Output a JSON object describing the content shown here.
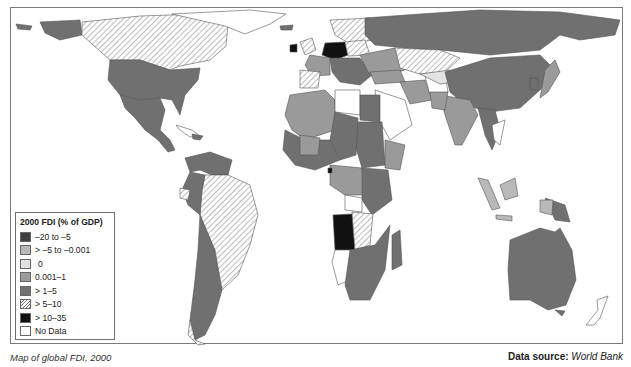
{
  "map": {
    "title": "Map of global FDI, 2000",
    "source_label": "Data source:",
    "source_value": "World Bank",
    "colors": {
      "neg_high": "#3f3f3f",
      "neg_low": "#b9b9b9",
      "zero": "#e3e3e3",
      "low": "#9a9a9a",
      "mid": "#707070",
      "hatch": "hatched",
      "high": "#111111",
      "no_data": "#ffffff"
    }
  },
  "legend": {
    "title": "2000 FDI (% of GDP)",
    "items": [
      {
        "label": "–20 to –5",
        "color": "#3f3f3f"
      },
      {
        "label": "> –5 to –0.001",
        "color": "#b9b9b9"
      },
      {
        "label": "0",
        "color": "#e3e3e3"
      },
      {
        "label": "0.001–1",
        "color": "#9a9a9a"
      },
      {
        "label": "> 1–5",
        "color": "#707070"
      },
      {
        "label": "> 5–10",
        "color": "hatched"
      },
      {
        "label": "> 10–35",
        "color": "#111111"
      },
      {
        "label": "No Data",
        "color": "#ffffff"
      }
    ]
  }
}
